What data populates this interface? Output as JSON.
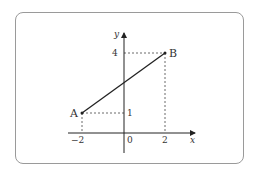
{
  "diagram": {
    "axes": {
      "x_label": "x",
      "y_label": "y",
      "origin_label": "0",
      "x_ticks": [
        {
          "value": -2,
          "label": "−2"
        },
        {
          "value": 2,
          "label": "2"
        }
      ],
      "y_ticks": [
        {
          "value": 1,
          "label": "1"
        },
        {
          "value": 4,
          "label": "4"
        }
      ]
    },
    "points": [
      {
        "name": "A",
        "x": -2,
        "y": 1
      },
      {
        "name": "B",
        "x": 2,
        "y": 4
      }
    ],
    "segment": {
      "from": "A",
      "to": "B"
    },
    "colors": {
      "line": "#222222",
      "dash": "#444444",
      "frame": "#9a9a9a"
    }
  }
}
